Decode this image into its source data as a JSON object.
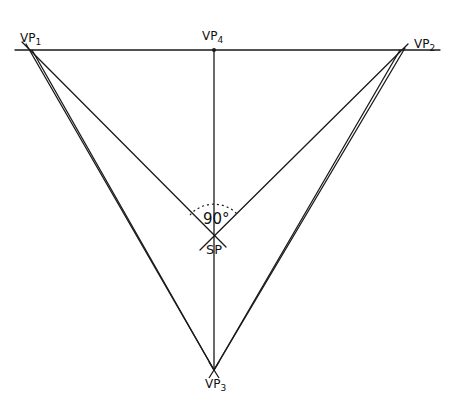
{
  "diagram": {
    "stroke_color": "#1a1a1a",
    "points": {
      "vp1": {
        "label": "VP",
        "sub": "1",
        "x": 30,
        "y": 50
      },
      "vp2": {
        "label": "VP",
        "sub": "2",
        "x": 402,
        "y": 50
      },
      "vp4": {
        "label": "VP",
        "sub": "4",
        "x": 214,
        "y": 50
      },
      "sp": {
        "label": "SP",
        "x": 214,
        "y": 235
      },
      "vp3": {
        "label": "VP",
        "sub": "3",
        "x": 214,
        "y": 370
      }
    },
    "angle_label": "90°",
    "lines": [
      {
        "name": "horizon-line",
        "from": [
          15,
          50
        ],
        "to": [
          440,
          50
        ]
      },
      {
        "name": "vertical-line",
        "from": [
          214,
          50
        ],
        "to": [
          214,
          370
        ]
      },
      {
        "name": "vp1-to-sp",
        "from": [
          22,
          42
        ],
        "to": [
          226,
          247
        ]
      },
      {
        "name": "vp2-to-sp",
        "from": [
          408,
          44
        ],
        "to": [
          200,
          250
        ]
      },
      {
        "name": "vp1-to-vp3-a",
        "from": [
          26,
          44
        ],
        "to": [
          214,
          370
        ]
      },
      {
        "name": "vp1-to-vp3-b",
        "from": [
          32,
          50
        ],
        "to": [
          214,
          370
        ]
      },
      {
        "name": "vp2-to-vp3-a",
        "from": [
          400,
          50
        ],
        "to": [
          214,
          370
        ]
      },
      {
        "name": "vp2-to-vp3-b",
        "from": [
          405,
          48
        ],
        "to": [
          214,
          370
        ]
      }
    ]
  }
}
